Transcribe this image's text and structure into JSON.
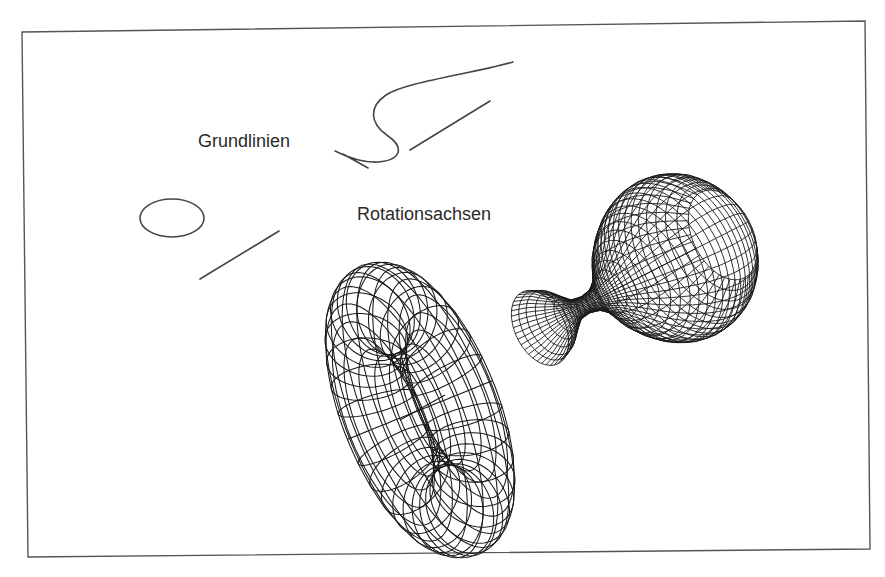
{
  "figure": {
    "frame_corners": [
      [
        22,
        32
      ],
      [
        865,
        21
      ],
      [
        870,
        549
      ],
      [
        28,
        557
      ]
    ],
    "frame_color": "#555555",
    "labels": {
      "baselines": "Grundlinien",
      "rotation_axes": "Rotationsachsen"
    },
    "label_positions": {
      "baselines": [
        198,
        132
      ],
      "rotation_axes": [
        357,
        205
      ]
    },
    "profile_curves": {
      "vase_profile": "M 513 62 C 470 74, 405 82, 386 95 C 370 106, 368 122, 388 136 C 404 147, 402 160, 378 162 C 360 163, 345 156, 335 151 M 343 154 L 368 168",
      "vase_axis": [
        [
          410,
          150
        ],
        [
          490,
          101
        ]
      ],
      "torus_circle": {
        "cx": 172,
        "cy": 218,
        "rx": 32,
        "ry": 19
      },
      "torus_axis": [
        [
          200,
          279
        ],
        [
          279,
          231
        ]
      ]
    },
    "torus": {
      "center": [
        420,
        410
      ],
      "major_radius": 92,
      "minor_radius": 40,
      "tilt_deg": -22,
      "view_x_scale": 0.42,
      "segments_major": 30,
      "segments_minor": 16,
      "hole_axis": [
        [
          400,
          420
        ],
        [
          445,
          395
        ]
      ]
    },
    "vase": {
      "origin": [
        540,
        328
      ],
      "axis_angle_deg": -27,
      "length": 205,
      "view_squash": 0.62,
      "profile_r": [
        40,
        34,
        22,
        11,
        9,
        12,
        22,
        38,
        55,
        68,
        78,
        84,
        86,
        84,
        78,
        66,
        48
      ],
      "segments_around": 40
    }
  }
}
